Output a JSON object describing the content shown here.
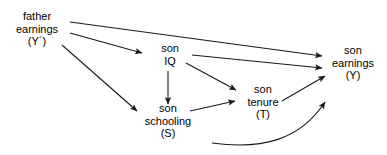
{
  "diagram": {
    "background_color": "#ffffff",
    "stroke_color": "#1a1a1a",
    "text_color": "#000000",
    "nodes": [
      {
        "id": "father_earnings",
        "name": "father-earnings-node",
        "lines": [
          "father",
          "earnings",
          "(Y´)"
        ],
        "x": 37,
        "y": 29
      },
      {
        "id": "son_iq",
        "name": "son-iq-node",
        "lines": [
          "son",
          "IQ",
          ""
        ],
        "x": 170,
        "y": 54
      },
      {
        "id": "son_schooling",
        "name": "son-schooling-node",
        "lines": [
          "son",
          "schooling",
          "(S)"
        ],
        "x": 168,
        "y": 121
      },
      {
        "id": "son_tenure",
        "name": "son-tenure-node",
        "lines": [
          "son",
          "tenure",
          "(T)"
        ],
        "x": 263,
        "y": 102
      },
      {
        "id": "son_earnings",
        "name": "son-earnings-node",
        "lines": [
          "son",
          "earnings",
          "(Y)"
        ],
        "x": 353,
        "y": 63
      }
    ],
    "edges": [
      {
        "id": "father_to_earnings",
        "name": "edge-father-earnings-to-son-earnings",
        "from": "father_earnings",
        "to": "son_earnings",
        "type": "straight",
        "path": "M 70 22 L 322 56"
      },
      {
        "id": "father_to_iq",
        "name": "edge-father-earnings-to-son-iq",
        "from": "father_earnings",
        "to": "son_iq",
        "type": "straight",
        "path": "M 70 33 L 142 53"
      },
      {
        "id": "father_to_schooling",
        "name": "edge-father-earnings-to-son-schooling",
        "from": "father_earnings",
        "to": "son_schooling",
        "type": "straight",
        "path": "M 62 45 L 137 111"
      },
      {
        "id": "iq_to_earnings",
        "name": "edge-son-iq-to-son-earnings",
        "from": "son_iq",
        "to": "son_earnings",
        "type": "straight",
        "path": "M 192 55 L 322 68"
      },
      {
        "id": "iq_to_schooling",
        "name": "edge-son-iq-to-son-schooling",
        "from": "son_iq",
        "to": "son_schooling",
        "type": "straight",
        "path": "M 168 71 L 168 104"
      },
      {
        "id": "iq_to_tenure",
        "name": "edge-son-iq-to-son-tenure",
        "from": "son_iq",
        "to": "son_tenure",
        "type": "straight",
        "path": "M 186 63 L 236 90"
      },
      {
        "id": "schooling_to_tenure",
        "name": "edge-son-schooling-to-son-tenure",
        "from": "son_schooling",
        "to": "son_tenure",
        "type": "straight",
        "path": "M 190 111 L 235 101"
      },
      {
        "id": "tenure_to_earnings",
        "name": "edge-son-tenure-to-son-earnings",
        "from": "son_tenure",
        "to": "son_earnings",
        "type": "straight",
        "path": "M 282 101 L 325 76"
      },
      {
        "id": "schooling_curve_to_earnings",
        "name": "edge-curved-to-son-earnings",
        "from": "son_schooling",
        "to": "son_earnings",
        "type": "curved",
        "path": "M 212 143 C 262 150, 300 140, 325 102"
      }
    ]
  }
}
